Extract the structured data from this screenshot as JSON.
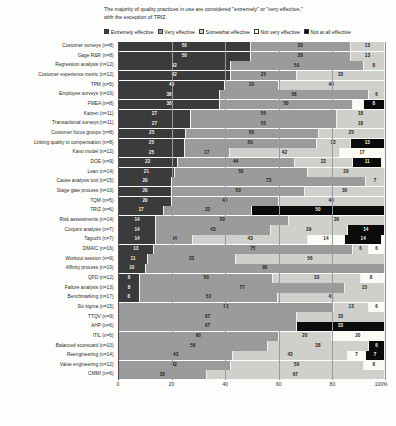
{
  "headline": {
    "line1": "The majority of quality practices in use are considered \"extremely\" or \"very effective,\"",
    "line2": "with the exception of TRIZ."
  },
  "legend": [
    {
      "label": "Extremely effective",
      "color": "#3b3b3b"
    },
    {
      "label": "Very effective",
      "color": "#9b9b9b"
    },
    {
      "label": "Somewhat effective",
      "color": "#cfcfcb"
    },
    {
      "label": "Not very effective",
      "color": "#fbfbf6"
    },
    {
      "label": "Not at all effective",
      "color": "#0b0b0b"
    }
  ],
  "chart_data": {
    "type": "bar",
    "orientation": "horizontal",
    "stacked": true,
    "percent": true,
    "title": "The majority of quality practices in use are considered \"extremely\" or \"very effective,\" with the exception of TRIZ.",
    "xlabel": "",
    "ylabel": "",
    "xlim": [
      0,
      100
    ],
    "xticks": [
      0,
      20,
      40,
      60,
      80,
      100
    ],
    "xticklabels": [
      "0",
      "20",
      "40",
      "60",
      "80",
      "100%"
    ],
    "grid": true,
    "legend_position": "top",
    "series": [
      {
        "name": "Extremely effective",
        "color": "#3b3b3b"
      },
      {
        "name": "Very effective",
        "color": "#9b9b9b"
      },
      {
        "name": "Somewhat effective",
        "color": "#cfcfcb"
      },
      {
        "name": "Not very effective",
        "color": "#fbfbf6"
      },
      {
        "name": "Not at all effective",
        "color": "#0b0b0b"
      }
    ],
    "categories": [
      "Customer surveys (n=8)",
      "Gage R&R (n=8)",
      "Regression analysis (n=12)",
      "Customer experience metric (n=12)",
      "TPM (n=5)",
      "Employee surveys (n=16)",
      "FMEA (n=8)",
      "Kaizen (n=11)",
      "Transactional surveys (n=11)",
      "Customer focus groups (n=8)",
      "Linking quality to compensation (n=8)",
      "Kano model (n=12)",
      "DOE (n=9)",
      "Lean (n=14)",
      "Cause analysis tool (n=15)",
      "Stage gate process (n=10)",
      "TQM (n=5)",
      "TRIZ (n=6)",
      "Risk assessments (n=14)",
      "Conjoint analysis (n=7)",
      "Taguchi (n=7)",
      "DMAIC (n=16)",
      "Workout session (n=9)",
      "Affinity process (n=10)",
      "QFD (n=12)",
      "Failure analysis (n=13)",
      "Benchmarking (n=17)",
      "Six sigma (n=15)",
      "TTQV (n=9)",
      "AHP (n=6)",
      "ITIL (n=6)",
      "Balanced scorecard (n=10)",
      "Reengineering (n=14)",
      "Value engineering (n=12)",
      "CMMI (n=6)"
    ],
    "rows": [
      {
        "category": "Customer surveys (n=8)",
        "values": [
          50,
          38,
          13,
          0,
          0
        ]
      },
      {
        "category": "Gage R&R (n=8)",
        "values": [
          50,
          38,
          13,
          0,
          0
        ]
      },
      {
        "category": "Regression analysis (n=12)",
        "values": [
          42,
          50,
          8,
          0,
          0
        ]
      },
      {
        "category": "Customer experience metric (n=12)",
        "values": [
          42,
          25,
          33,
          0,
          0
        ]
      },
      {
        "category": "TPM (n=5)",
        "values": [
          40,
          20,
          40,
          0,
          0
        ]
      },
      {
        "category": "Employee surveys (n=16)",
        "values": [
          38,
          56,
          6,
          0,
          0
        ]
      },
      {
        "category": "FMEA (n=8)",
        "values": [
          38,
          50,
          0,
          4,
          8
        ]
      },
      {
        "category": "Kaizen (n=11)",
        "values": [
          27,
          55,
          18,
          0,
          0
        ]
      },
      {
        "category": "Transactional surveys (n=11)",
        "values": [
          27,
          55,
          18,
          0,
          0
        ]
      },
      {
        "category": "Customer focus groups (n=8)",
        "values": [
          25,
          50,
          25,
          0,
          0
        ]
      },
      {
        "category": "Linking quality to compensation (n=8)",
        "values": [
          25,
          50,
          13,
          0,
          13
        ]
      },
      {
        "category": "Kano model (n=12)",
        "values": [
          25,
          17,
          42,
          17,
          0
        ]
      },
      {
        "category": "DOE (n=9)",
        "values": [
          22,
          44,
          22,
          0,
          11
        ]
      },
      {
        "category": "Lean (n=14)",
        "values": [
          21,
          50,
          29,
          0,
          0
        ]
      },
      {
        "category": "Cause analysis tool (n=15)",
        "values": [
          20,
          73,
          7,
          0,
          0
        ]
      },
      {
        "category": "Stage gate process (n=10)",
        "values": [
          20,
          50,
          30,
          0,
          0
        ]
      },
      {
        "category": "TQM (n=5)",
        "values": [
          20,
          40,
          40,
          0,
          0
        ]
      },
      {
        "category": "TRIZ (n=6)",
        "values": [
          17,
          33,
          0,
          0,
          50
        ]
      },
      {
        "category": "Risk assessments (n=14)",
        "values": [
          14,
          50,
          36,
          0,
          0
        ]
      },
      {
        "category": "Conjoint analysis (n=7)",
        "values": [
          14,
          43,
          29,
          0,
          14
        ]
      },
      {
        "category": "Taguchi (n=7)",
        "values": [
          14,
          14,
          43,
          14,
          14
        ]
      },
      {
        "category": "DMAIC (n=16)",
        "values": [
          13,
          75,
          6,
          6,
          0
        ]
      },
      {
        "category": "Workout session (n=9)",
        "values": [
          11,
          33,
          56,
          0,
          0
        ]
      },
      {
        "category": "Affinity process (n=10)",
        "values": [
          10,
          90,
          0,
          0,
          0
        ]
      },
      {
        "category": "QFD (n=12)",
        "values": [
          8,
          50,
          33,
          8,
          0
        ]
      },
      {
        "category": "Failure analysis (n=13)",
        "values": [
          8,
          77,
          15,
          0,
          0
        ]
      },
      {
        "category": "Benchmarking (n=17)",
        "values": [
          8,
          53,
          41,
          0,
          0
        ]
      },
      {
        "category": "Six sigma (n=15)",
        "values": [
          0,
          81,
          13,
          6,
          0
        ]
      },
      {
        "category": "TTQV (n=9)",
        "values": [
          0,
          67,
          33,
          0,
          0
        ]
      },
      {
        "category": "AHP (n=6)",
        "values": [
          0,
          67,
          0,
          0,
          33
        ]
      },
      {
        "category": "ITIL (n=6)",
        "values": [
          0,
          60,
          20,
          20,
          0
        ]
      },
      {
        "category": "Balanced scorecard (n=10)",
        "values": [
          0,
          56,
          38,
          0,
          6
        ]
      },
      {
        "category": "Reengineering (n=14)",
        "values": [
          0,
          43,
          43,
          7,
          7
        ]
      },
      {
        "category": "Value engineering (n=12)",
        "values": [
          0,
          42,
          50,
          8,
          0
        ]
      },
      {
        "category": "CMMI (n=6)",
        "values": [
          0,
          33,
          67,
          0,
          0
        ]
      }
    ]
  }
}
